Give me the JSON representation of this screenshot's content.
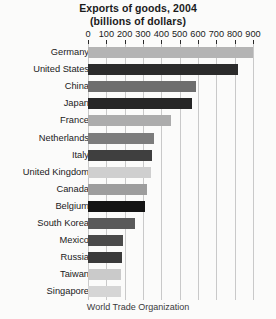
{
  "chart_data": {
    "type": "bar",
    "orientation": "horizontal",
    "title": "Exports of goods, 2004",
    "subtitle": "(billions of dollars)",
    "xlabel": "",
    "ylabel": "",
    "xlim": [
      0,
      900
    ],
    "xticks": [
      0,
      100,
      200,
      300,
      400,
      500,
      600,
      700,
      800,
      900
    ],
    "grid": true,
    "axis_position": "top",
    "legend": "none",
    "units": "billions of dollars",
    "year": 2004,
    "categories": [
      "Germany",
      "United States",
      "China",
      "Japan",
      "France",
      "Netherlands",
      "Italy",
      "United Kingdom",
      "Canada",
      "Belgium",
      "South Korea",
      "Mexico",
      "Russia",
      "Taiwan",
      "Singapore"
    ],
    "values": [
      900,
      820,
      590,
      565,
      450,
      360,
      350,
      345,
      320,
      310,
      255,
      190,
      185,
      180,
      180
    ],
    "colors": [
      "#b4b4b4",
      "#2b2b2b",
      "#6e6e6e",
      "#262626",
      "#acacac",
      "#7c7c7c",
      "#3f3f3f",
      "#cfcfcf",
      "#9d9d9d",
      "#141414",
      "#5a5a5a",
      "#4a4a4a",
      "#3a3a3a",
      "#cacaca",
      "#d5d5d5"
    ]
  },
  "footnote": "World Trade Organization"
}
